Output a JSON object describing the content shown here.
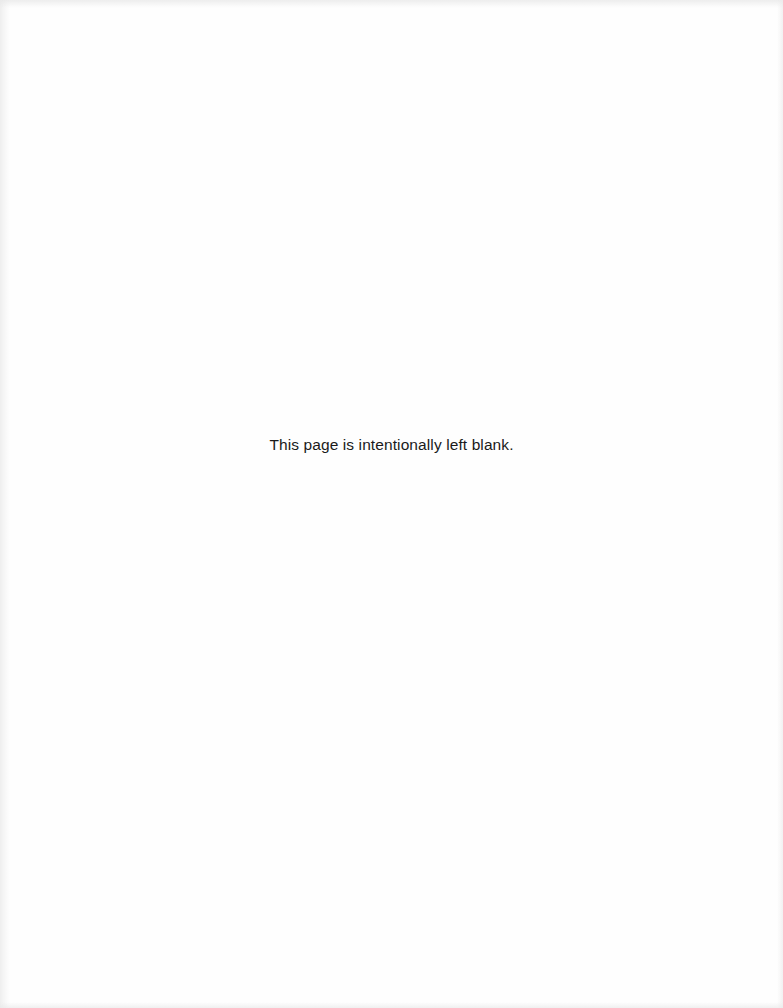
{
  "page": {
    "notice": "This page is intentionally left blank.",
    "background": "#fefefe",
    "text_color": "#1a1a1a"
  }
}
